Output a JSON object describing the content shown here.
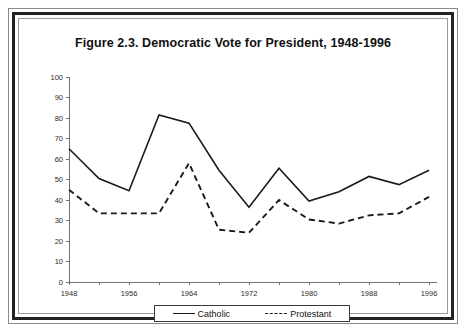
{
  "figure": {
    "title": "Figure 2.3.  Democratic Vote for President, 1948-1996"
  },
  "legend": {
    "entries": [
      {
        "label": "Catholic",
        "style": "solid",
        "icon": "solid-line-icon"
      },
      {
        "label": "Protestant",
        "style": "dashed",
        "icon": "dashed-line-icon"
      }
    ]
  },
  "chart_data": {
    "type": "line",
    "title": "Figure 2.3.  Democratic Vote for President, 1948-1996",
    "xlabel": "",
    "ylabel": "",
    "xlim": [
      1948,
      1996
    ],
    "ylim": [
      0,
      100
    ],
    "grid": false,
    "legend_position": "bottom",
    "x": [
      1948,
      1952,
      1956,
      1960,
      1964,
      1968,
      1972,
      1976,
      1980,
      1984,
      1988,
      1992,
      1996
    ],
    "x_tick_labels": [
      "1948",
      "1956",
      "1964",
      "1972",
      "1980",
      "1988",
      "1996"
    ],
    "x_tick_values": [
      1948,
      1956,
      1964,
      1972,
      1980,
      1988,
      1996
    ],
    "y_tick_labels": [
      "0",
      "10",
      "20",
      "30",
      "40",
      "50",
      "60",
      "70",
      "80",
      "90",
      "100"
    ],
    "y_tick_values": [
      0,
      10,
      20,
      30,
      40,
      50,
      60,
      70,
      80,
      90,
      100
    ],
    "series": [
      {
        "name": "Catholic",
        "style": "solid",
        "values": [
          65,
          50.5,
          44.5,
          81.5,
          77.5,
          54.5,
          36.5,
          55.5,
          39.5,
          44,
          51.5,
          47.5,
          54.5
        ]
      },
      {
        "name": "Protestant",
        "style": "dashed",
        "values": [
          45,
          33.5,
          33.5,
          33.5,
          58,
          25.5,
          24,
          40,
          30.5,
          28.5,
          32.5,
          33.5,
          41.5
        ]
      }
    ]
  }
}
